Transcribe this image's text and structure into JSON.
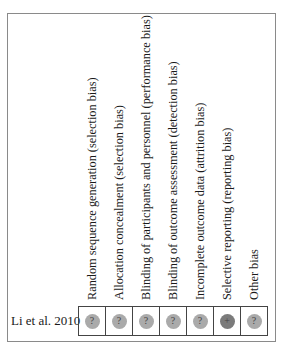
{
  "columns": [
    {
      "label": "Random sequence generation (selection bias)"
    },
    {
      "label": "Allocation concealment (selection bias)"
    },
    {
      "label": "Blinding of participants and personnel (performance bias)"
    },
    {
      "label": "Blinding of outcome assessment (detection bias)"
    },
    {
      "label": "Incomplete outcome data (attrition bias)"
    },
    {
      "label": "Selective reporting (reporting bias)"
    },
    {
      "label": "Other bias"
    }
  ],
  "rows": [
    {
      "study": "Li et al. 2010",
      "judgements": [
        {
          "symbol": "?",
          "risk": "unclear"
        },
        {
          "symbol": "?",
          "risk": "unclear"
        },
        {
          "symbol": "?",
          "risk": "unclear"
        },
        {
          "symbol": "?",
          "risk": "unclear"
        },
        {
          "symbol": "?",
          "risk": "unclear"
        },
        {
          "symbol": "+",
          "risk": "low"
        },
        {
          "symbol": "?",
          "risk": "unclear"
        }
      ]
    }
  ],
  "colors": {
    "unclear": "#aaaaaa",
    "low": "#7b7b7b",
    "border": "#444444",
    "frame": "#8a8a8a"
  }
}
